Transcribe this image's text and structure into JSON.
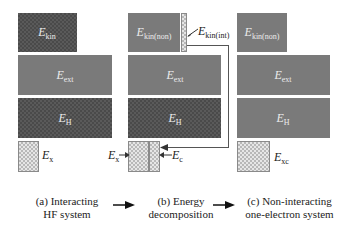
{
  "panels": {
    "a": {
      "caption_line1": "(a) Interacting",
      "caption_line2": "HF system",
      "kin": {
        "main": "E",
        "sub": "kin"
      },
      "ext": {
        "main": "E",
        "sub": "ext"
      },
      "H": {
        "main": "E",
        "sub": "H"
      },
      "x": {
        "main": "E",
        "sub": "x"
      }
    },
    "b": {
      "caption_line1": "(b) Energy",
      "caption_line2": "decomposition",
      "kin_non": {
        "main": "E",
        "sub": "kin(non)"
      },
      "kin_int": {
        "main": "E",
        "sub": "kin(int)"
      },
      "ext": {
        "main": "E",
        "sub": "ext"
      },
      "H": {
        "main": "E",
        "sub": "H"
      },
      "x": {
        "main": "E",
        "sub": "x"
      },
      "c": {
        "main": "E",
        "sub": "c"
      }
    },
    "c": {
      "caption_line1": "(c) Non-interacting",
      "caption_line2": "one-electron system",
      "kin_non": {
        "main": "E",
        "sub": "kin(non)"
      },
      "ext": {
        "main": "E",
        "sub": "ext"
      },
      "H": {
        "main": "E",
        "sub": "H"
      },
      "xc": {
        "main": "E",
        "sub": "xc"
      }
    }
  },
  "arrows": [
    "arrow-a-to-b",
    "arrow-b-to-c"
  ]
}
